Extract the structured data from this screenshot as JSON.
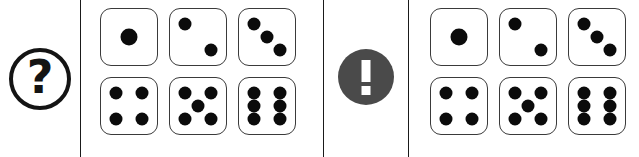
{
  "canvas": {
    "width": 639,
    "height": 157,
    "background": "#ffffff"
  },
  "colors": {
    "ink": "#0b0b0b",
    "divider": "#1a1a1a",
    "die_border": "#3a3a3a",
    "die_face": "#ffffff",
    "pip": "#0b0b0b",
    "alert_circle": "#4a4a4a",
    "alert_glyph": "#ffffff",
    "question_outline": "#141414"
  },
  "panels": [
    {
      "name": "question-badge-panel",
      "icon": "question-mark-circle-icon",
      "glyph": "?"
    },
    {
      "name": "left-dice-panel",
      "label": "left-dice-group",
      "rows": 2,
      "columns": 3,
      "dice": [
        {
          "value": 1,
          "pips": [
            "center"
          ]
        },
        {
          "value": 2,
          "pips": [
            "top-left",
            "bottom-right"
          ]
        },
        {
          "value": 3,
          "pips": [
            "top-left",
            "center",
            "bottom-right"
          ]
        },
        {
          "value": 4,
          "pips": [
            "top-left",
            "top-right",
            "bottom-left",
            "bottom-right"
          ]
        },
        {
          "value": 5,
          "pips": [
            "top-left",
            "top-right",
            "center",
            "bottom-left",
            "bottom-right"
          ]
        },
        {
          "value": 6,
          "pips": [
            "top-left",
            "top-right",
            "middle-left",
            "middle-right",
            "bottom-left",
            "bottom-right"
          ]
        }
      ]
    },
    {
      "name": "alert-badge-panel",
      "icon": "exclamation-mark-circle-icon",
      "glyph": "!"
    },
    {
      "name": "right-dice-panel",
      "label": "right-dice-group",
      "rows": 2,
      "columns": 3,
      "dice": [
        {
          "value": 1,
          "pips": [
            "center"
          ]
        },
        {
          "value": 2,
          "pips": [
            "top-left",
            "bottom-right"
          ]
        },
        {
          "value": 3,
          "pips": [
            "top-left",
            "center",
            "bottom-right"
          ]
        },
        {
          "value": 4,
          "pips": [
            "top-left",
            "top-right",
            "bottom-left",
            "bottom-right"
          ]
        },
        {
          "value": 5,
          "pips": [
            "top-left",
            "top-right",
            "center",
            "bottom-left",
            "bottom-right"
          ]
        },
        {
          "value": 6,
          "pips": [
            "top-left",
            "top-right",
            "middle-left",
            "middle-right",
            "bottom-left",
            "bottom-right"
          ]
        }
      ]
    }
  ],
  "dividers": [
    {
      "name": "divider-1",
      "x": 80
    },
    {
      "name": "divider-2",
      "x": 323
    },
    {
      "name": "divider-3",
      "x": 408
    }
  ]
}
